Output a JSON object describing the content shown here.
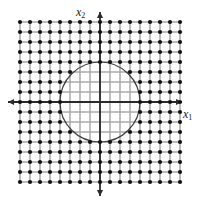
{
  "figure": {
    "title": "",
    "width": 200,
    "height": 204,
    "background": "#ffffff"
  },
  "axes": {
    "horizontal": {
      "name": "x1",
      "label_base": "x",
      "label_sub": "1",
      "color": "#2a2a2a",
      "arrow_both_ends": true,
      "y_pixel": 102,
      "x_start_pixel": 8,
      "x_end_pixel": 182
    },
    "vertical": {
      "name": "x2",
      "label_base": "x",
      "label_sub": "2",
      "color": "#2a2a2a",
      "arrow_both_ends": true,
      "x_pixel": 100,
      "y_start_pixel": 12,
      "y_end_pixel": 196
    }
  },
  "chart_data": {
    "type": "scatter",
    "title": "",
    "xlabel": "x1",
    "ylabel": "x2",
    "grid": true,
    "legend": null,
    "lattice": {
      "x_values": [
        -8,
        -7,
        -6,
        -5,
        -4,
        -3,
        -2,
        -1,
        0,
        1,
        2,
        3,
        4,
        5,
        6,
        7,
        8
      ],
      "y_values": [
        -8,
        -7,
        -6,
        -5,
        -4,
        -3,
        -2,
        -1,
        0,
        1,
        2,
        3,
        4,
        5,
        6,
        7,
        8
      ],
      "spacing": 1,
      "point_count_total": 289,
      "point_color": "#111111",
      "point_radius_px": 2.1,
      "grid_line_color": "#3d3d3d",
      "grid_line_color_inside_circle": "#c8c8c8",
      "hide_points_inside_circle": true
    },
    "circle": {
      "center": [
        0,
        0
      ],
      "radius": 4,
      "stroke": "#3a3a3a",
      "stroke_width_px": 1.2,
      "fill": "none"
    },
    "xlim": [
      -8,
      8
    ],
    "ylim": [
      -8,
      8
    ],
    "pixel_mapping": {
      "origin_x_px": 100,
      "origin_y_px": 102,
      "unit_px": 10
    }
  }
}
